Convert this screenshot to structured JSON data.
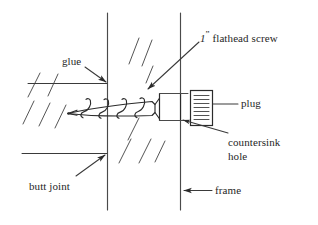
{
  "figure": {
    "type": "technical-line-drawing",
    "background_color": "#ffffff",
    "ink_color": "#2b2b2b"
  },
  "labels": {
    "glue": "glue",
    "butt_joint": "butt joint",
    "frame": "frame",
    "plug": "plug",
    "countersink_hole_line1": "countersink",
    "countersink_hole_line2": "hole",
    "screw_measure": "1",
    "screw_measure_unit": "”",
    "screw_name": "flathead screw"
  },
  "parts": {
    "screw": {
      "name": "flathead screw",
      "size": "1”",
      "tip": "pointed",
      "head": "flat rectangular head",
      "thread_loops": 4
    },
    "plug": {
      "name": "plug",
      "grain_lines": 7
    },
    "countersink_hole": {
      "name": "countersink hole"
    },
    "frame": {
      "name": "frame"
    },
    "butt_joint": {
      "name": "butt joint"
    },
    "glue": {
      "name": "glue"
    }
  },
  "geometry": {
    "left_board_edge_x": 107,
    "frame_edge_x": 180,
    "vertical_line_top_y": 13,
    "vertical_line_bottom_y": 210,
    "screw_axis_y": 107
  }
}
